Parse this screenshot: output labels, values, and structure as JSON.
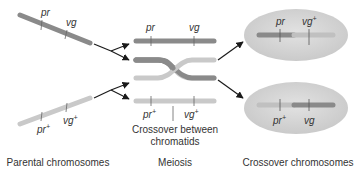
{
  "colors": {
    "dark_chromosome": "#8a8a8a",
    "light_chromosome": "#c9c9c9",
    "cell_fill": "#d4d4d4",
    "arrow": "#1a1a1a",
    "text": "#333333",
    "tick": "#666666"
  },
  "parental": {
    "top": {
      "gene1": "pr",
      "gene2": "vg"
    },
    "bottom": {
      "gene1": "pr",
      "gene1_sup": "+",
      "gene2": "vg",
      "gene2_sup": "+"
    }
  },
  "meiosis": {
    "top": {
      "gene1": "pr",
      "gene2": "vg"
    },
    "bottom": {
      "gene1": "pr",
      "gene1_sup": "+",
      "gene2": "vg",
      "gene2_sup": "+"
    },
    "crossover_label_line1": "Crossover between",
    "crossover_label_line2": "chromatids"
  },
  "crossover": {
    "top_cell": {
      "gene1": "pr",
      "gene2": "vg",
      "gene2_sup": "+"
    },
    "bottom_cell": {
      "gene1": "pr",
      "gene1_sup": "+",
      "gene2": "vg"
    }
  },
  "captions": {
    "parental": "Parental chromosomes",
    "meiosis": "Meiosis",
    "crossover": "Crossover chromosomes"
  }
}
